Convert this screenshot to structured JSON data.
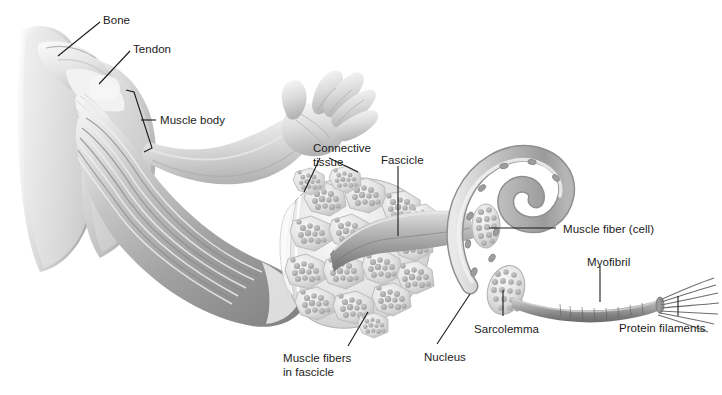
{
  "figure": {
    "background_color": "#ffffff",
    "ink_color": "#1b1b1b",
    "bleed_through_text": "Skeletal Muscle A",
    "bleed_through_color": "#f2f2f2"
  },
  "labels": [
    {
      "id": "bone",
      "text": "Bone",
      "x": 103,
      "y": 14
    },
    {
      "id": "tendon",
      "text": "Tendon",
      "x": 133,
      "y": 43
    },
    {
      "id": "muscle-body",
      "text": "Muscle body",
      "x": 160,
      "y": 114
    },
    {
      "id": "connective-tissue",
      "text": "Connective\ntissue",
      "x": 313,
      "y": 142
    },
    {
      "id": "fascicle",
      "text": "Fascicle",
      "x": 381,
      "y": 154
    },
    {
      "id": "muscle-fiber-cell",
      "text": "Muscle fiber (cell)",
      "x": 563,
      "y": 223
    },
    {
      "id": "myofibril",
      "text": "Myofibril",
      "x": 587,
      "y": 256
    },
    {
      "id": "protein-filaments",
      "text": "Protein filaments",
      "x": 619,
      "y": 322
    },
    {
      "id": "sarcolemma",
      "text": "Sarcolemma",
      "x": 474,
      "y": 323
    },
    {
      "id": "nucleus",
      "text": "Nucleus",
      "x": 424,
      "y": 351
    },
    {
      "id": "muscle-fibers",
      "text": "Muscle fibers\nin fascicle",
      "x": 283,
      "y": 352
    }
  ],
  "anatomy": {
    "structures": [
      {
        "id": "shoulder-torso",
        "name": "shoulder and torso silhouette"
      },
      {
        "id": "scapula-humerus",
        "name": "bone (scapula and humerus)"
      },
      {
        "id": "tendon-fibers",
        "name": "tendon attaching muscle to bone"
      },
      {
        "id": "muscle-belly",
        "name": "striated muscle body"
      },
      {
        "id": "forearm",
        "name": "forearm"
      },
      {
        "id": "open-hand",
        "name": "open hand with spread fingers"
      },
      {
        "id": "muscle-cross-section",
        "name": "cut muscle showing fascicles"
      },
      {
        "id": "extracted-fascicle",
        "name": "fascicle pulled out of the cut muscle"
      },
      {
        "id": "muscle-fiber-tube",
        "name": "curved muscle fiber with nuclei in sarcolemma"
      },
      {
        "id": "myofibril-rod",
        "name": "banded myofibril"
      },
      {
        "id": "filament-strands",
        "name": "frayed protein filaments"
      }
    ],
    "fascicle_count": 17,
    "fibers_per_fascicle_range": "8-14"
  }
}
